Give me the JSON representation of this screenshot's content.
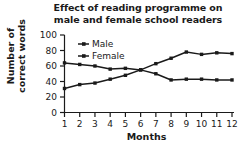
{
  "chart_data": {
    "type": "line",
    "title": "Effect of reading programme on male and female school readers",
    "title_lines": [
      "Effect of reading programme on",
      "male and female school readers"
    ],
    "xlabel": "Months",
    "ylabel": "Number of correct words",
    "ylabel_lines": [
      "Number of",
      "correct words"
    ],
    "categories": [
      1,
      2,
      3,
      4,
      5,
      6,
      7,
      8,
      9,
      10,
      11,
      12
    ],
    "xtick_labels": [
      "1",
      "2",
      "3",
      "4",
      "5",
      "6",
      "7",
      "8",
      "9",
      "10",
      "11",
      "12"
    ],
    "ytick_labels": [
      "0",
      "20",
      "40",
      "60",
      "80",
      "100"
    ],
    "ytick_values": [
      0,
      20,
      40,
      60,
      80,
      100
    ],
    "ylim": [
      0,
      100
    ],
    "xlim": [
      1,
      12
    ],
    "grid": false,
    "legend_position": "upper-left-inside",
    "series": [
      {
        "name": "Male",
        "color": "#1a1a1a",
        "marker": "square",
        "values": [
          31,
          36,
          38,
          43,
          48,
          55,
          63,
          70,
          78,
          75,
          77,
          76
        ]
      },
      {
        "name": "Female",
        "color": "#1a1a1a",
        "marker": "square",
        "values": [
          64,
          62,
          60,
          56,
          57,
          55,
          50,
          42,
          43,
          43,
          42,
          42
        ]
      }
    ]
  },
  "legend": {
    "items": [
      {
        "label": "Male"
      },
      {
        "label": "Female"
      }
    ]
  },
  "colors": {
    "background": "#ffffff",
    "axis": "#1a1a1a",
    "line": "#1a1a1a",
    "text": "#1a1a1a"
  }
}
